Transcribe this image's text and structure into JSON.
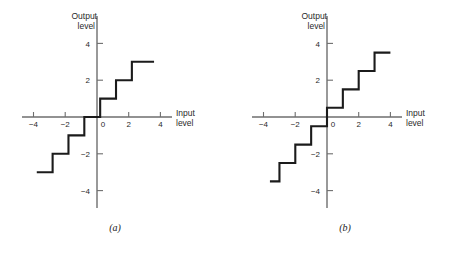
{
  "figure": {
    "background": "#ffffff",
    "line_color": "#1b1b1b",
    "axis_color": "#6e6e6e"
  },
  "panels": [
    {
      "id": "a",
      "caption": "(a)",
      "chart_data": {
        "type": "line",
        "title": "",
        "subtitle": "",
        "xlabel_line1": "Input",
        "xlabel_line2": "level",
        "ylabel_line1": "Output",
        "ylabel_line2": "level",
        "xlim": [
          -4.6,
          4.6
        ],
        "ylim": [
          -4.9,
          4.9
        ],
        "xticks": [
          -4,
          -2,
          0,
          2,
          4
        ],
        "xticklabels": [
          "−4",
          "−2",
          "0",
          "2",
          "4"
        ],
        "yticks": [
          -4,
          -2,
          2,
          4
        ],
        "yticklabels": [
          "−4",
          "−2",
          "−2",
          "4"
        ],
        "ytick_values_shown": [
          "4",
          "2",
          "−2",
          "−4"
        ],
        "grid": false,
        "legend": false,
        "quantizer": "midtread",
        "step_width": 1,
        "step_height": 1,
        "step_offset": 0.2,
        "series": [
          {
            "name": "midtread quantizer characteristic",
            "points": [
              [
                -3.8,
                -3
              ],
              [
                -2.8,
                -3
              ],
              [
                -2.8,
                -2
              ],
              [
                -1.8,
                -2
              ],
              [
                -1.8,
                -1
              ],
              [
                -0.8,
                -1
              ],
              [
                -0.8,
                0
              ],
              [
                0.2,
                0
              ],
              [
                0.2,
                1
              ],
              [
                1.2,
                1
              ],
              [
                1.2,
                2
              ],
              [
                2.2,
                2
              ],
              [
                2.2,
                3
              ],
              [
                3.6,
                3
              ]
            ]
          }
        ]
      }
    },
    {
      "id": "b",
      "caption": "(b)",
      "chart_data": {
        "type": "line",
        "title": "",
        "subtitle": "",
        "xlabel_line1": "Input",
        "xlabel_line2": "level",
        "ylabel_line1": "Output",
        "ylabel_level2": "level",
        "ylabel_line2": "level",
        "xlim": [
          -4.6,
          4.6
        ],
        "ylim": [
          -4.9,
          4.9
        ],
        "xticks": [
          -4,
          -2,
          0,
          2,
          4
        ],
        "xticklabels": [
          "−4",
          "−2",
          "0",
          "2",
          "4"
        ],
        "yticks": [
          -4,
          -2,
          2,
          4
        ],
        "ytick_values_shown": [
          "4",
          "2",
          "−2",
          "−4"
        ],
        "grid": false,
        "legend": false,
        "quantizer": "midrise",
        "step_width": 1,
        "step_height": 1,
        "step_offset": 0,
        "series": [
          {
            "name": "midrise quantizer characteristic",
            "points": [
              [
                -3.6,
                -3.5
              ],
              [
                -3.0,
                -3.5
              ],
              [
                -3.0,
                -2.5
              ],
              [
                -2.0,
                -2.5
              ],
              [
                -2.0,
                -1.5
              ],
              [
                -1.0,
                -1.5
              ],
              [
                -1.0,
                -0.5
              ],
              [
                0.0,
                -0.5
              ],
              [
                0.0,
                0.5
              ],
              [
                1.0,
                0.5
              ],
              [
                1.0,
                1.5
              ],
              [
                2.0,
                1.5
              ],
              [
                2.0,
                2.5
              ],
              [
                3.0,
                2.5
              ],
              [
                3.0,
                3.5
              ],
              [
                4.0,
                3.5
              ]
            ]
          }
        ]
      }
    }
  ]
}
